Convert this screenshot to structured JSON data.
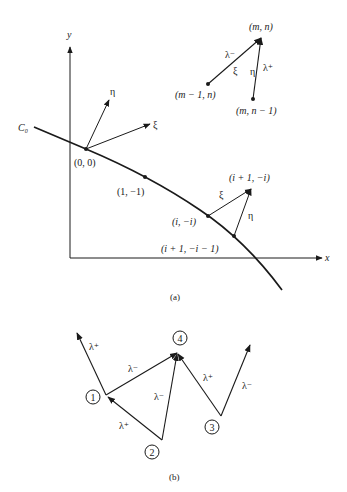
{
  "panel_a": {
    "caption": "(a)",
    "axes": {
      "x_label": "x",
      "y_label": "y"
    },
    "curve_label": "𝒞₀",
    "curve_label_text": "C",
    "curve_label_sub": "0",
    "origin_frame": {
      "eta": "η",
      "xi": "ξ"
    },
    "points": [
      {
        "label": "(0, 0)"
      },
      {
        "label": "(1, −1)"
      },
      {
        "label": "(i, −i)"
      },
      {
        "label": "(i + 1, −i − 1)"
      },
      {
        "label": "(i + 1, −i)"
      }
    ],
    "boundary_step": {
      "xi": "ξ",
      "eta": "η"
    },
    "stencil": {
      "top": "(m, n)",
      "left": "(m − 1, n)",
      "bottom": "(m, n − 1)",
      "lambda_minus": "λ⁻",
      "lambda_plus": "λ⁺",
      "xi": "ξ",
      "eta": "η"
    }
  },
  "panel_b": {
    "caption": "(b)",
    "nodes": [
      "1",
      "2",
      "3",
      "4"
    ],
    "edge_labels": {
      "node1_up": "λ⁺",
      "node1_to_4": "λ⁻",
      "node2_to_1": "λ⁺",
      "node2_to_4": "λ⁻",
      "node3_to_4": "λ⁺",
      "node3_up": "λ⁻"
    }
  }
}
